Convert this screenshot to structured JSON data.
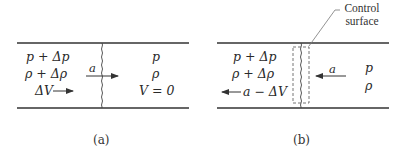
{
  "figure": {
    "panel_a": {
      "caption": "(a)",
      "upstream": {
        "pressure": "p + Δp",
        "density": "ρ + Δρ",
        "velocity": "ΔV"
      },
      "wave_speed": "a",
      "downstream": {
        "pressure": "p",
        "density": "ρ",
        "velocity": "V = 0"
      }
    },
    "panel_b": {
      "caption": "(b)",
      "control_surface_label_line1": "Control",
      "control_surface_label_line2": "surface",
      "upstream": {
        "pressure": "p + Δp",
        "density": "ρ + Δρ",
        "velocity": "a − ΔV"
      },
      "wave_speed": "a",
      "downstream": {
        "pressure": "p",
        "density": "ρ"
      }
    },
    "colors": {
      "line": "#333333",
      "dashed": "#666666",
      "background": "#ffffff"
    }
  }
}
